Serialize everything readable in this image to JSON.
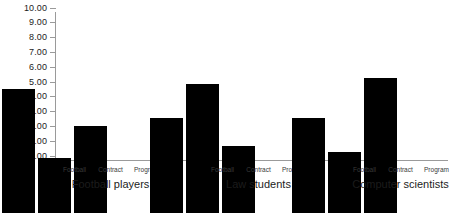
{
  "chart_data": {
    "type": "bar",
    "title": "",
    "subtitle": "",
    "xlabel": "",
    "ylabel": "",
    "ylim": [
      0,
      10
    ],
    "ytick_labels": [
      "10.00",
      "9.00",
      "8.00",
      "7.00",
      "6.00",
      "5.00",
      "4.00",
      "3.00",
      "2.00",
      "1.00",
      "0.00"
    ],
    "ytick_values": [
      10,
      9,
      8,
      7,
      6,
      5,
      4,
      3,
      2,
      1,
      0
    ],
    "grid": false,
    "legend_position": "none",
    "categories": [
      "Football players",
      "Law students",
      "Computer scientists"
    ],
    "series": [
      {
        "name": "Football",
        "values": [
          8.4,
          6.4,
          6.4
        ]
      },
      {
        "name": "Contract",
        "values": [
          3.7,
          8.7,
          4.1
        ]
      },
      {
        "name": "Program",
        "values": [
          5.9,
          4.5,
          9.1
        ]
      }
    ],
    "groups": [
      {
        "title": "Football players",
        "bars": [
          {
            "series": "Football",
            "value": 8.4
          },
          {
            "series": "Contract",
            "value": 3.7
          },
          {
            "series": "Program",
            "value": 5.9
          }
        ]
      },
      {
        "title": "Law students",
        "bars": [
          {
            "series": "Football",
            "value": 6.4
          },
          {
            "series": "Contract",
            "value": 8.7
          },
          {
            "series": "Program",
            "value": 4.5
          }
        ]
      },
      {
        "title": "Computer scientists",
        "bars": [
          {
            "series": "Football",
            "value": 6.4
          },
          {
            "series": "Contract",
            "value": 4.1
          },
          {
            "series": "Program",
            "value": 9.1
          }
        ]
      }
    ],
    "colors": {
      "bar": "#000000",
      "axis": "#9a9a9a",
      "text": "#1c1c1c",
      "series_label": "#3a3a3a",
      "background": "#ffffff"
    }
  }
}
